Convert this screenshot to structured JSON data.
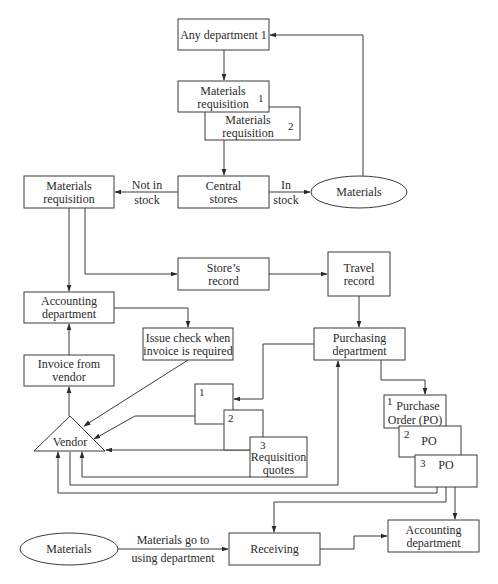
{
  "diagram": {
    "type": "flowchart",
    "nodes": {
      "any_department": {
        "line1": "Any department 1"
      },
      "mat_req_1": {
        "line1": "Materials",
        "line2": "requisition",
        "num": "1"
      },
      "mat_req_2": {
        "line1": "Materials",
        "line2": "requisition",
        "num": "2"
      },
      "central_stores": {
        "line1": "Central",
        "line2": "stores"
      },
      "materials_top": {
        "line1": "Materials"
      },
      "mat_req_left": {
        "line1": "Materials",
        "line2": "requisition"
      },
      "stores_record": {
        "line1": "Store’s",
        "line2": "record"
      },
      "travel_record": {
        "line1": "Travel",
        "line2": "record"
      },
      "accounting_left": {
        "line1": "Accounting",
        "line2": "department"
      },
      "issue_check": {
        "line1": "Issue check when",
        "line2": "invoice is required"
      },
      "invoice_vendor": {
        "line1": "Invoice from",
        "line2": "vendor"
      },
      "purchasing": {
        "line1": "Purchasing",
        "line2": "department"
      },
      "vendor": {
        "line1": "Vendor"
      },
      "req_quote_1": {
        "num": "1"
      },
      "req_quote_2": {
        "num": "2"
      },
      "req_quote_3": {
        "num": "3",
        "line1": "Requisition",
        "line2": "quotes"
      },
      "po_1": {
        "num": "1",
        "line1": "Purchase",
        "line2": "Order (PO)"
      },
      "po_2": {
        "num": "2",
        "line1": "PO"
      },
      "po_3": {
        "num": "3",
        "line1": "PO"
      },
      "materials_bottom": {
        "line1": "Materials"
      },
      "receiving": {
        "line1": "Receiving"
      },
      "accounting_bottom": {
        "line1": "Accounting",
        "line2": "department"
      }
    },
    "edge_labels": {
      "not_in_stock": {
        "line1": "Not in",
        "line2": "stock"
      },
      "in_stock": {
        "line1": "In",
        "line2": "stock"
      },
      "materials_go": {
        "line1": "Materials go to",
        "line2": "using department"
      }
    },
    "edges": [
      {
        "from": "any_department",
        "to": "mat_req_1"
      },
      {
        "from": "mat_req_2",
        "to": "central_stores"
      },
      {
        "from": "central_stores",
        "to": "mat_req_left",
        "label": "Not in stock"
      },
      {
        "from": "central_stores",
        "to": "materials_top",
        "label": "In stock"
      },
      {
        "from": "materials_top",
        "to": "any_department"
      },
      {
        "from": "mat_req_left",
        "to": "accounting_left"
      },
      {
        "from": "mat_req_left",
        "to": "stores_record"
      },
      {
        "from": "stores_record",
        "to": "travel_record"
      },
      {
        "from": "travel_record",
        "to": "purchasing"
      },
      {
        "from": "accounting_left",
        "to": "issue_check"
      },
      {
        "from": "issue_check",
        "to": "vendor"
      },
      {
        "from": "invoice_vendor",
        "to": "accounting_left"
      },
      {
        "from": "vendor",
        "to": "invoice_vendor"
      },
      {
        "from": "purchasing",
        "to": "req_quote_1"
      },
      {
        "from": "req_quote_1",
        "to": "vendor"
      },
      {
        "from": "req_quote_2",
        "to": "vendor"
      },
      {
        "from": "req_quote_3",
        "to": "vendor"
      },
      {
        "from": "vendor",
        "to": "purchasing"
      },
      {
        "from": "purchasing",
        "to": "po_1"
      },
      {
        "from": "po_3",
        "to": "vendor"
      },
      {
        "from": "po_3",
        "to": "receiving"
      },
      {
        "from": "po_3",
        "to": "accounting_bottom"
      },
      {
        "from": "materials_bottom",
        "to": "receiving",
        "label": "Materials go to using department"
      },
      {
        "from": "receiving",
        "to": "accounting_bottom"
      }
    ]
  }
}
